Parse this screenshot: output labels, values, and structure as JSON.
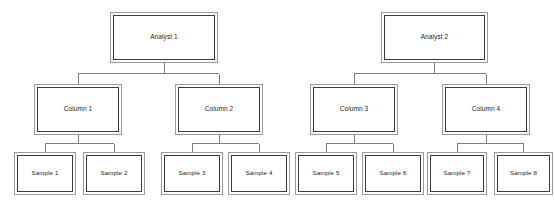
{
  "diagram": {
    "type": "org-chart",
    "colors": {
      "background": "#ffffff",
      "outer_border": "#9a9a9a",
      "inner_border": "#3a3a3a",
      "connector": "#7d7d7d",
      "text": "#1d1d1d"
    },
    "levels": [
      "analyst",
      "column",
      "sample"
    ],
    "nodes": {
      "analyst1": {
        "label": "Analyst 1",
        "x": 110,
        "y": 12,
        "w": 108,
        "h": 51
      },
      "analyst2": {
        "label": "Analyst 2",
        "x": 381,
        "y": 12,
        "w": 107,
        "h": 51
      },
      "column1": {
        "label": "Column 1",
        "x": 34,
        "y": 84,
        "w": 88,
        "h": 51
      },
      "column2": {
        "label": "Column 2",
        "x": 175,
        "y": 84,
        "w": 88,
        "h": 51
      },
      "column3": {
        "label": "Column 3",
        "x": 310,
        "y": 84,
        "w": 88,
        "h": 51
      },
      "column4": {
        "label": "Column 4",
        "x": 442,
        "y": 84,
        "w": 88,
        "h": 51
      },
      "sample1": {
        "label": "Sample 1",
        "x": 14,
        "y": 152,
        "w": 62,
        "h": 43
      },
      "sample2": {
        "label": "Sample 2",
        "x": 83,
        "y": 152,
        "w": 62,
        "h": 43
      },
      "sample3": {
        "label": "Sample 3",
        "x": 161,
        "y": 152,
        "w": 62,
        "h": 43
      },
      "sample4": {
        "label": "Sample 4",
        "x": 228,
        "y": 152,
        "w": 62,
        "h": 43
      },
      "sample5": {
        "label": "Sample 5",
        "x": 295,
        "y": 152,
        "w": 62,
        "h": 43
      },
      "sample6": {
        "label": "Sample 6",
        "x": 362,
        "y": 152,
        "w": 62,
        "h": 43
      },
      "sample7": {
        "label": "Sample 7",
        "x": 427,
        "y": 152,
        "w": 60,
        "h": 43
      },
      "sample8": {
        "label": "Sample 8",
        "x": 494,
        "y": 152,
        "w": 59,
        "h": 43
      }
    },
    "edges": [
      {
        "from": "analyst1",
        "to": "column1"
      },
      {
        "from": "analyst1",
        "to": "column2"
      },
      {
        "from": "analyst2",
        "to": "column3"
      },
      {
        "from": "analyst2",
        "to": "column4"
      },
      {
        "from": "column1",
        "to": "sample1"
      },
      {
        "from": "column1",
        "to": "sample2"
      },
      {
        "from": "column2",
        "to": "sample3"
      },
      {
        "from": "column2",
        "to": "sample4"
      },
      {
        "from": "column3",
        "to": "sample5"
      },
      {
        "from": "column3",
        "to": "sample6"
      },
      {
        "from": "column4",
        "to": "sample7"
      },
      {
        "from": "column4",
        "to": "sample8"
      }
    ]
  }
}
